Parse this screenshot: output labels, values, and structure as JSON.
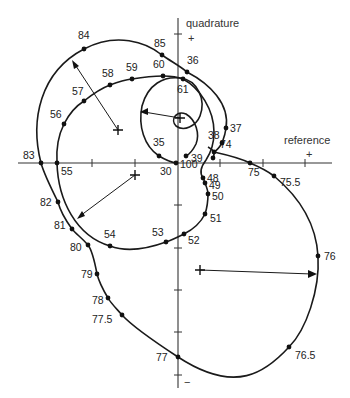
{
  "axes": {
    "x_label": "reference",
    "y_label": "quadrature",
    "x_plus": "+",
    "y_plus": "+",
    "y_minus": "−"
  },
  "curves": [
    {
      "name": "outer-loop",
      "points": [
        {
          "label": "74",
          "x": 214,
          "y": 152
        },
        {
          "label": "75",
          "x": 250,
          "y": 163
        },
        {
          "label": "75.5",
          "x": 274,
          "y": 176
        },
        {
          "label": "76",
          "x": 318,
          "y": 256
        },
        {
          "label": "76.5",
          "x": 289,
          "y": 347
        },
        {
          "label": "77",
          "x": 178,
          "y": 357
        },
        {
          "label": "77.5",
          "x": 122,
          "y": 315
        },
        {
          "label": "78",
          "x": 108,
          "y": 298
        },
        {
          "label": "79",
          "x": 97,
          "y": 274
        },
        {
          "label": "80",
          "x": 88,
          "y": 245
        },
        {
          "label": "81",
          "x": 72,
          "y": 229
        },
        {
          "label": "82",
          "x": 58,
          "y": 202
        },
        {
          "label": "83",
          "x": 41,
          "y": 163
        },
        {
          "label": "84",
          "x": 84,
          "y": 49
        },
        {
          "label": "85",
          "x": 162,
          "y": 55
        },
        {
          "label": "36",
          "x": 187,
          "y": 72
        }
      ]
    },
    {
      "name": "middle-loop",
      "points": [
        {
          "label": "55",
          "x": 57,
          "y": 163
        },
        {
          "label": "56",
          "x": 64,
          "y": 124
        },
        {
          "label": "57",
          "x": 84,
          "y": 101
        },
        {
          "label": "58",
          "x": 110,
          "y": 85
        },
        {
          "label": "59",
          "x": 132,
          "y": 79
        },
        {
          "label": "60",
          "x": 163,
          "y": 76
        },
        {
          "label": "61",
          "x": 183,
          "y": 79
        },
        {
          "label": "48",
          "x": 203,
          "y": 178
        },
        {
          "label": "49",
          "x": 205,
          "y": 183
        },
        {
          "label": "50",
          "x": 208,
          "y": 194
        },
        {
          "label": "51",
          "x": 205,
          "y": 214
        },
        {
          "label": "52",
          "x": 184,
          "y": 234
        },
        {
          "label": "53",
          "x": 166,
          "y": 242
        },
        {
          "label": "54",
          "x": 110,
          "y": 246
        }
      ]
    },
    {
      "name": "inner-loop",
      "points": [
        {
          "label": "30",
          "x": 176,
          "y": 163
        },
        {
          "label": "35",
          "x": 159,
          "y": 156
        },
        {
          "label": "37",
          "x": 226,
          "y": 128
        },
        {
          "label": "38",
          "x": 222,
          "y": 143
        },
        {
          "label": "39",
          "x": 213,
          "y": 158
        },
        {
          "label": "100",
          "x": 186,
          "y": 156
        }
      ]
    }
  ],
  "centers": [
    {
      "name": "outer-upper-center",
      "x": 118,
      "y": 130
    },
    {
      "name": "middle-center",
      "x": 135,
      "y": 175
    },
    {
      "name": "inner-center",
      "x": 180,
      "y": 118
    },
    {
      "name": "outer-lower-center",
      "x": 200,
      "y": 270
    }
  ],
  "radius_arrows": [
    {
      "from": [
        118,
        130
      ],
      "to": [
        72,
        60
      ]
    },
    {
      "from": [
        135,
        175
      ],
      "to": [
        77,
        218
      ]
    },
    {
      "from": [
        180,
        118
      ],
      "to": [
        140,
        112
      ]
    },
    {
      "from": [
        200,
        270
      ],
      "to": [
        317,
        274
      ]
    }
  ]
}
